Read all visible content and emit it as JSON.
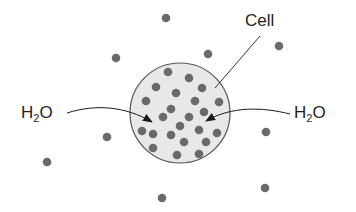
{
  "diagram": {
    "type": "osmosis",
    "colors": {
      "background": "#ffffff",
      "cell_fill": "#e8e8e8",
      "cell_outline": "#555555",
      "solute": "#6a6a6a",
      "arrow": "#1a1a1a",
      "text": "#1f1f1f"
    },
    "cell": {
      "label": "Cell",
      "cx": 180,
      "cy": 113,
      "r": 50
    },
    "labels": {
      "cell": "Cell",
      "left_water": {
        "main": "H",
        "sub": "2",
        "tail": "O"
      },
      "right_water": {
        "main": "H",
        "sub": "2",
        "tail": "O"
      }
    },
    "solute_outside": [
      [
        166,
        18
      ],
      [
        279,
        46
      ],
      [
        208,
        54
      ],
      [
        116,
        58
      ],
      [
        107,
        137
      ],
      [
        266,
        132
      ],
      [
        47,
        162
      ],
      [
        265,
        188
      ],
      [
        162,
        198
      ]
    ],
    "solute_inside": [
      [
        168,
        72
      ],
      [
        189,
        78
      ],
      [
        156,
        87
      ],
      [
        202,
        88
      ],
      [
        176,
        93
      ],
      [
        146,
        101
      ],
      [
        195,
        101
      ],
      [
        219,
        102
      ],
      [
        171,
        109
      ],
      [
        204,
        112
      ],
      [
        163,
        117
      ],
      [
        189,
        117
      ],
      [
        180,
        126
      ],
      [
        142,
        131
      ],
      [
        153,
        134
      ],
      [
        199,
        130
      ],
      [
        217,
        133
      ],
      [
        171,
        135
      ],
      [
        206,
        142
      ],
      [
        184,
        142
      ],
      [
        153,
        148
      ],
      [
        177,
        155
      ],
      [
        199,
        154
      ]
    ]
  }
}
